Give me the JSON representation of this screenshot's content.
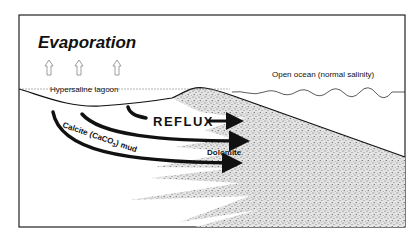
{
  "diagram": {
    "title": "Evaporation",
    "labels": {
      "lagoon": "Hypersaline lagoon",
      "ocean": "Open ocean (normal salinity)",
      "reflux": "REFLUX",
      "dolomite": "Dolomite",
      "mud_prefix": "Calcite (CaCO",
      "mud_subscript": "3",
      "mud_suffix": ") mud"
    },
    "evaporation_arrow_count": 3,
    "flow_arrow_count": 3,
    "colors": {
      "ink": "#111111",
      "background": "#ffffff",
      "stipple": "#8a8a8a"
    }
  }
}
